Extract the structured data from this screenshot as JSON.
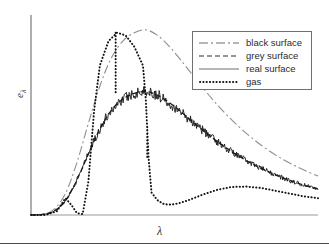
{
  "figure": {
    "background": "#ffffff",
    "axis_color": "#9a9a9a",
    "curve_color": "#1a1a1a",
    "black_surface_color": "#8a8a8a",
    "legend_border_color": "#6f6f6f",
    "rule_color": "#4a4a4a"
  },
  "axes": {
    "xlabel": "λ",
    "ylabel_symbol": "e",
    "ylabel_subscript": "λ",
    "ylabel_full": "eλ",
    "x_ticks": [],
    "y_ticks": [],
    "grid": false
  },
  "legend": {
    "position": "top-right",
    "entries": [
      {
        "label": "black surface",
        "style": "dash-dot",
        "sample": "dashdot-line-sample"
      },
      {
        "label": "grey surface",
        "style": "dashed",
        "sample": "dashed-line-sample"
      },
      {
        "label": "real surface",
        "style": "solid",
        "sample": "solid-line-sample"
      },
      {
        "label": "gas",
        "style": "dotted",
        "sample": "dotted-line-sample"
      }
    ]
  },
  "chart_data": {
    "type": "line",
    "title": "",
    "subtitle": "",
    "xlabel": "λ",
    "ylabel": "eλ",
    "xlim": [
      0,
      1
    ],
    "ylim": [
      0,
      1
    ],
    "grid": false,
    "legend_position": "top-right",
    "annotations": [],
    "series": [
      {
        "name": "black surface",
        "style": "dash-dot",
        "x": [
          0.0,
          0.04,
          0.08,
          0.12,
          0.16,
          0.2,
          0.24,
          0.28,
          0.32,
          0.36,
          0.4,
          0.44,
          0.48,
          0.52,
          0.56,
          0.6,
          0.64,
          0.68,
          0.72,
          0.76,
          0.8,
          0.84,
          0.88,
          0.92,
          0.96,
          1.0
        ],
        "y": [
          0.0,
          0.004,
          0.03,
          0.115,
          0.28,
          0.49,
          0.69,
          0.84,
          0.93,
          0.975,
          0.99,
          0.962,
          0.905,
          0.832,
          0.755,
          0.678,
          0.605,
          0.538,
          0.478,
          0.424,
          0.376,
          0.333,
          0.296,
          0.263,
          0.234,
          0.208
        ]
      },
      {
        "name": "grey surface",
        "style": "dashed",
        "x": [
          0.0,
          0.04,
          0.08,
          0.12,
          0.16,
          0.2,
          0.24,
          0.28,
          0.32,
          0.36,
          0.4,
          0.44,
          0.48,
          0.52,
          0.56,
          0.6,
          0.64,
          0.68,
          0.72,
          0.76,
          0.8,
          0.84,
          0.88,
          0.92,
          0.96,
          1.0
        ],
        "y": [
          0.0,
          0.003,
          0.02,
          0.077,
          0.187,
          0.327,
          0.46,
          0.56,
          0.62,
          0.65,
          0.66,
          0.641,
          0.603,
          0.555,
          0.503,
          0.452,
          0.403,
          0.359,
          0.319,
          0.283,
          0.251,
          0.222,
          0.197,
          0.175,
          0.156,
          0.139
        ]
      },
      {
        "name": "real surface",
        "style": "solid",
        "description": "grey surface envelope with superimposed random fluctuation of roughly ±0.03",
        "x": [
          0.0,
          0.04,
          0.08,
          0.12,
          0.16,
          0.2,
          0.24,
          0.28,
          0.32,
          0.36,
          0.4,
          0.44,
          0.48,
          0.52,
          0.56,
          0.6,
          0.64,
          0.68,
          0.72,
          0.76,
          0.8,
          0.84,
          0.88,
          0.92,
          0.96,
          1.0
        ],
        "y": [
          0.0,
          0.004,
          0.024,
          0.071,
          0.196,
          0.319,
          0.472,
          0.549,
          0.634,
          0.641,
          0.668,
          0.628,
          0.615,
          0.543,
          0.495,
          0.466,
          0.391,
          0.371,
          0.305,
          0.296,
          0.239,
          0.235,
          0.185,
          0.188,
          0.144,
          0.151
        ]
      },
      {
        "name": "gas",
        "style": "dotted",
        "description": "banded spectrum: small low-wavelength band, tall main band with a narrow internal notch and sharp edges, then a broad weak long-wavelength hump",
        "x": [
          0.0,
          0.05,
          0.09,
          0.12,
          0.14,
          0.16,
          0.18,
          0.2,
          0.22,
          0.24,
          0.27,
          0.3,
          0.33,
          0.36,
          0.39,
          0.4,
          0.41,
          0.42,
          0.44,
          0.46,
          0.48,
          0.5,
          0.52,
          0.55,
          0.6,
          0.65,
          0.7,
          0.75,
          0.8,
          0.85,
          0.9,
          0.95,
          1.0
        ],
        "y": [
          0.0,
          0.0,
          0.02,
          0.09,
          0.055,
          0.01,
          0.005,
          0.18,
          0.56,
          0.8,
          0.93,
          0.975,
          0.96,
          0.9,
          0.8,
          0.62,
          0.3,
          0.12,
          0.08,
          0.06,
          0.055,
          0.058,
          0.065,
          0.08,
          0.11,
          0.135,
          0.15,
          0.152,
          0.145,
          0.13,
          0.115,
          0.1,
          0.09
        ]
      }
    ]
  }
}
